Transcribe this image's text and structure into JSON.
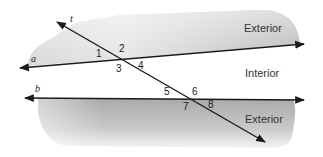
{
  "figure": {
    "lines": {
      "a": {
        "label": "a"
      },
      "b": {
        "label": "b"
      },
      "t": {
        "label": "t"
      }
    },
    "regions": {
      "top": {
        "label": "Exterior"
      },
      "middle": {
        "label": "Interior"
      },
      "bottom": {
        "label": "Exterior"
      }
    },
    "angles": [
      "1",
      "2",
      "3",
      "4",
      "5",
      "6",
      "7",
      "8"
    ],
    "colors": {
      "shade_dark": "#b8b8b8",
      "shade_light": "#f2f2f2",
      "line": "#1a1a1a",
      "background": "#ffffff"
    }
  }
}
